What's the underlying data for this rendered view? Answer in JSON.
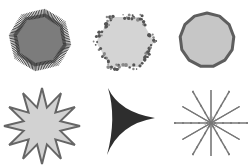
{
  "canvas": {
    "width": 250,
    "height": 167,
    "background": "#ffffff"
  },
  "shapes": [
    {
      "name": "hairy-octagon",
      "kind": "polygon",
      "sides": 8,
      "cx": 40,
      "cy": 40,
      "r": 27,
      "fill": "#7c7c7c",
      "edge": "bristles",
      "edge_color": "#333333"
    },
    {
      "name": "speckled-hexagon",
      "kind": "polygon",
      "sides": 6,
      "cx": 125,
      "cy": 42,
      "r": 29,
      "fill": "#d4d4d4",
      "edge": "speckles",
      "edge_color": "#555555"
    },
    {
      "name": "outlined-circle-polygon",
      "kind": "polygon",
      "sides": 13,
      "cx": 207,
      "cy": 40,
      "r": 27,
      "fill": "#c6c6c6",
      "edge": "stroke",
      "edge_color": "#5e5e5e",
      "stroke_width": 3
    },
    {
      "name": "twelve-point-star",
      "kind": "star",
      "points": 12,
      "cx": 42,
      "cy": 126,
      "r_outer": 38,
      "r_inner": 19,
      "fill": "#d2d2d2",
      "edge": "stroke",
      "edge_color": "#666666",
      "stroke_width": 2
    },
    {
      "name": "three-point-star",
      "kind": "concave-triangle",
      "cx": 121,
      "cy": 122,
      "fill": "#2e2e2e"
    },
    {
      "name": "dashed-burst",
      "kind": "rays",
      "rays": 12,
      "cx": 211,
      "cy": 123,
      "r": 37,
      "stroke": "#777777"
    }
  ]
}
